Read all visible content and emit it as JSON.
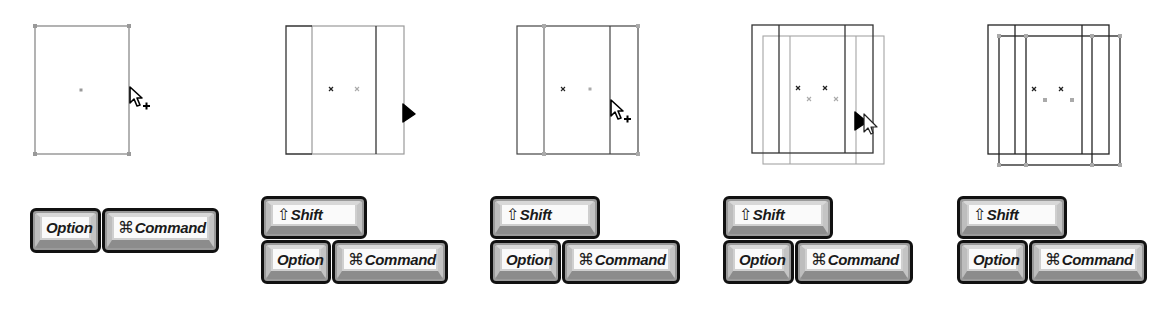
{
  "figure": {
    "colors": {
      "primary_stroke": "#222222",
      "ghost_stroke": "#9a9a9a",
      "handle": "#999999",
      "key_face": "#fafafa",
      "key_border": "#111111"
    },
    "panels": [
      {
        "id": "step-1",
        "keys": {
          "row1": [],
          "row2": [
            {
              "name": "option",
              "label": "Option",
              "glyph": ""
            },
            {
              "name": "command",
              "label": "Command",
              "glyph": "⌘"
            }
          ]
        },
        "cursor": "arrow-plus"
      },
      {
        "id": "step-2",
        "keys": {
          "row1": [
            {
              "name": "shift",
              "label": "Shift",
              "glyph": "⇧"
            }
          ],
          "row2": [
            {
              "name": "option",
              "label": "Option",
              "glyph": ""
            },
            {
              "name": "command",
              "label": "Command",
              "glyph": "⌘"
            }
          ]
        },
        "cursor": "arrow-filled"
      },
      {
        "id": "step-3",
        "keys": {
          "row1": [
            {
              "name": "shift",
              "label": "Shift",
              "glyph": "⇧"
            }
          ],
          "row2": [
            {
              "name": "option",
              "label": "Option",
              "glyph": ""
            },
            {
              "name": "command",
              "label": "Command",
              "glyph": "⌘"
            }
          ]
        },
        "cursor": "arrow-plus"
      },
      {
        "id": "step-4",
        "keys": {
          "row1": [
            {
              "name": "shift",
              "label": "Shift",
              "glyph": "⇧"
            }
          ],
          "row2": [
            {
              "name": "option",
              "label": "Option",
              "glyph": ""
            },
            {
              "name": "command",
              "label": "Command",
              "glyph": "⌘"
            }
          ]
        },
        "cursor": "arrow-filled-with-outline"
      },
      {
        "id": "step-5",
        "keys": {
          "row1": [
            {
              "name": "shift",
              "label": "Shift",
              "glyph": "⇧"
            }
          ],
          "row2": [
            {
              "name": "option",
              "label": "Option",
              "glyph": ""
            },
            {
              "name": "command",
              "label": "Command",
              "glyph": "⌘"
            }
          ]
        },
        "cursor": "none"
      }
    ]
  }
}
